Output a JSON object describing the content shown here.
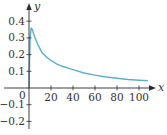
{
  "chart_data": {
    "type": "line",
    "title": "",
    "xlabel": "x",
    "ylabel": "y",
    "xlim": [
      0,
      110
    ],
    "ylim": [
      -0.25,
      0.5
    ],
    "grid": false,
    "legend": null,
    "x_ticks": [
      20,
      40,
      60,
      80,
      100
    ],
    "x_tick_labels": [
      "20",
      "40",
      "60",
      "80",
      "100"
    ],
    "y_ticks": [
      -0.2,
      -0.1,
      0,
      0.1,
      0.2,
      0.3,
      0.4
    ],
    "y_tick_labels": [
      "−0.2",
      "−0.1",
      "0",
      "0.1",
      "0.2",
      "0.3",
      "0.4"
    ],
    "origin_label": "0",
    "series": [
      {
        "name": "curve",
        "color": "#5aaed0",
        "x": [
          0,
          0.5,
          1,
          2,
          3,
          5,
          8,
          12,
          16,
          20,
          25,
          30,
          40,
          50,
          60,
          70,
          80,
          90,
          100,
          108
        ],
        "y": [
          0,
          0.15,
          0.3,
          0.36,
          0.35,
          0.31,
          0.26,
          0.21,
          0.185,
          0.165,
          0.145,
          0.13,
          0.11,
          0.09,
          0.077,
          0.066,
          0.058,
          0.051,
          0.046,
          0.043
        ]
      }
    ]
  },
  "colors": {
    "axis": "#2b2b2b",
    "curve": "#5aaed0",
    "text": "#333333"
  }
}
